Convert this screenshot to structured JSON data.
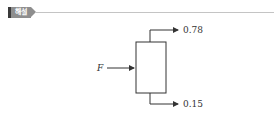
{
  "header": {
    "tag_label": "해설",
    "tag_color": "#8e8e8e",
    "rule_color": "#c4c4c4"
  },
  "diagram": {
    "input_label": "F",
    "top_output_value": "0.78",
    "bottom_output_value": "0.15",
    "line_color": "#333333"
  }
}
